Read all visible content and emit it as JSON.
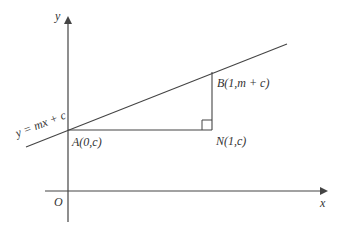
{
  "diagram": {
    "axes": {
      "x_label": "x",
      "y_label": "y",
      "origin_label": "O"
    },
    "line": {
      "equation_label": "y = mx + c"
    },
    "points": {
      "A": {
        "label": "A(0,c)"
      },
      "B": {
        "label": "B(1,m + c)"
      },
      "N": {
        "label": "N(1,c)"
      }
    },
    "right_angle_at": "N",
    "colors": {
      "stroke": "#444444",
      "text": "#333333"
    }
  }
}
